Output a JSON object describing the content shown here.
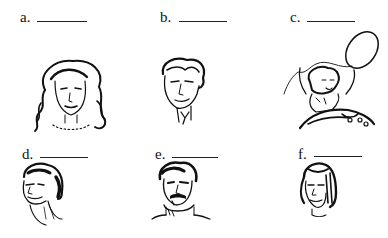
{
  "worksheet": {
    "items": [
      {
        "label": "a.",
        "answer": "",
        "picture": "woman-curly-hair-necklace"
      },
      {
        "label": "b.",
        "answer": "",
        "picture": "man-wavy-hair-tie"
      },
      {
        "label": "c.",
        "answer": "",
        "picture": "girl-with-balloon"
      },
      {
        "label": "d.",
        "answer": "",
        "picture": "man-square-jaw"
      },
      {
        "label": "e.",
        "answer": "",
        "picture": "man-mustache-turtleneck"
      },
      {
        "label": "f.",
        "answer": "",
        "picture": "woman-straight-hair"
      }
    ]
  }
}
